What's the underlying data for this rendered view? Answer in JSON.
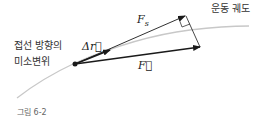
{
  "labels": {
    "trajectory": "운동 궤도",
    "tangent_line1": "접선 방향의",
    "tangent_line2": "미소변위",
    "Fs": "F",
    "Fs_sub": "s",
    "delta_r": "Δr⃗",
    "F": "F⃗",
    "caption": "그림 6-2"
  },
  "colors": {
    "curve": "#c8c8c8",
    "arrow": "#1a1a1a",
    "text": "#333333"
  }
}
